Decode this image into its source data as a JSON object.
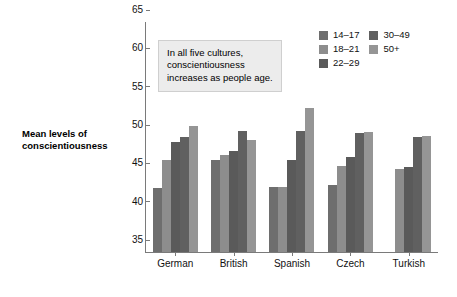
{
  "chart_data": {
    "type": "bar",
    "title": "",
    "xlabel": "",
    "ylabel": "Mean levels of conscientiousness",
    "ylim": [
      35,
      65
    ],
    "yticks": [
      35,
      40,
      45,
      50,
      55,
      60,
      65
    ],
    "grid": false,
    "legend_position": "top-right",
    "categories": [
      "German",
      "British",
      "Spanish",
      "Czech",
      "Turkish"
    ],
    "series": [
      {
        "name": "14–17",
        "color": "#6e6e6e",
        "values": [
          43.3,
          47.0,
          43.5,
          43.8,
          null
        ]
      },
      {
        "name": "18–21",
        "color": "#8d8d8d",
        "values": [
          47.0,
          47.6,
          43.5,
          46.2,
          45.8
        ]
      },
      {
        "name": "22–29",
        "color": "#5a5a5a",
        "values": [
          49.3,
          48.2,
          47.0,
          47.4,
          46.1
        ]
      },
      {
        "name": "30–49",
        "color": "#606060",
        "values": [
          50.0,
          50.8,
          50.8,
          50.5,
          50.0
        ]
      },
      {
        "name": "50+",
        "color": "#959595",
        "values": [
          51.5,
          49.6,
          53.8,
          50.6,
          50.1
        ]
      }
    ],
    "annotation": "In all five cultures, conscientiousness increases as people age."
  },
  "axes": {
    "y_title_line1": "Mean levels of",
    "y_title_line2": "conscientiousness",
    "y_tick_labels": [
      "65",
      "60",
      "55",
      "50",
      "45",
      "40",
      "35"
    ]
  },
  "legend": {
    "column_left": [
      "14–17",
      "18–21",
      "22–29"
    ],
    "column_right": [
      "30–49",
      "50+"
    ]
  },
  "annotation": {
    "line1": "In all five cultures,",
    "line2": "conscientiousness",
    "line3": "increases as people age."
  },
  "colors": {
    "axis": "#7a7a7a",
    "annotation_bg": "#ececec",
    "annotation_border": "#cfcfcf",
    "text": "#111111"
  }
}
